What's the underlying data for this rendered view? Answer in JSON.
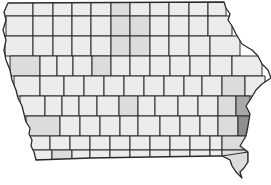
{
  "map": {
    "region": "Iowa",
    "subdivision": "counties",
    "colors": {
      "level0": "#ececec",
      "level1": "#dcdcdc",
      "level2": "#cfcfcf",
      "level3": "#a9a9a9",
      "level4": "#8e8e8e",
      "border": "#2a2a2a",
      "background": "#ffffff"
    },
    "shaded_counties": [
      {
        "approx_position": "north-central row 2",
        "level": "level1"
      },
      {
        "approx_position": "north-central row 2-3",
        "level": "level1"
      },
      {
        "approx_position": "north-central row 4",
        "level": "level1"
      },
      {
        "approx_position": "western row 4",
        "level": "level1"
      },
      {
        "approx_position": "central row 6",
        "level": "level1"
      },
      {
        "approx_position": "southwest row 7",
        "level": "level1"
      },
      {
        "approx_position": "southwest row 9",
        "level": "level1"
      },
      {
        "approx_position": "eastern row 5",
        "level": "level1"
      },
      {
        "approx_position": "eastern row 6",
        "level": "level1"
      },
      {
        "approx_position": "east Clinton",
        "level": "level3"
      },
      {
        "approx_position": "east Scott",
        "level": "level4"
      },
      {
        "approx_position": "Jackson",
        "level": "level1"
      },
      {
        "approx_position": "Muscatine",
        "level": "level2"
      },
      {
        "approx_position": "Louisa",
        "level": "level1"
      },
      {
        "approx_position": "Des Moines",
        "level": "level1"
      },
      {
        "approx_position": "Lee",
        "level": "level1"
      }
    ]
  }
}
